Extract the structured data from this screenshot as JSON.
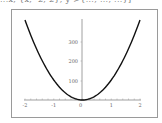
{
  "header": {
    "code_fragment": "...x, {x, -2, 2}, y->{..., ..., ...}]"
  },
  "chart_data": {
    "type": "line",
    "title": "",
    "xlabel": "",
    "ylabel": "",
    "function": "parabola (y proportional to x^2)",
    "x_ticks": [
      "-2",
      "-1",
      "0",
      "1",
      "2"
    ],
    "y_ticks": [
      "100",
      "200",
      "300"
    ],
    "xlim": [
      -2,
      2
    ],
    "ylim": [
      0,
      410
    ],
    "grid": false,
    "series": [
      {
        "name": "curve",
        "x": [
          -2,
          -1.5,
          -1,
          -0.5,
          0,
          0.5,
          1,
          1.5,
          2
        ],
        "y": [
          410,
          231,
          103,
          26,
          0,
          26,
          103,
          231,
          410
        ]
      }
    ]
  }
}
